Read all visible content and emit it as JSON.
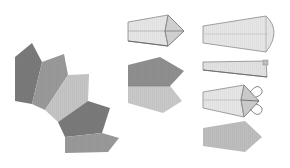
{
  "diagram": {
    "colors": {
      "dark": "#7a7a7a",
      "mid": "#999999",
      "light": "#c4c4c4",
      "paper": "#e6e6e6",
      "paper_alt": "#d9d9d9",
      "outline": "#8a8a8a",
      "background": "#ffffff"
    },
    "fan_pieces": [
      {
        "id": 1,
        "shade": "dark"
      },
      {
        "id": 2,
        "shade": "mid"
      },
      {
        "id": 3,
        "shade": "light"
      },
      {
        "id": 4,
        "shade": "dark"
      },
      {
        "id": 5,
        "shade": "mid"
      }
    ],
    "steps": [
      {
        "id": "folded-point-piece",
        "description": "Paper strip with pointed end folded"
      },
      {
        "id": "two-tone-pentagon",
        "description": "Pentagon piece, dark top half and light bottom half"
      },
      {
        "id": "tapered-strip-rounded",
        "description": "Tapered strip with rounded end"
      },
      {
        "id": "tapered-strip-folded",
        "description": "Tapered strip folded in half lengthwise"
      },
      {
        "id": "point-fold-arrows",
        "description": "Pointed end folded with curved fold arrows"
      },
      {
        "id": "finished-pentagon",
        "description": "Finished elongated pentagon piece"
      }
    ]
  }
}
